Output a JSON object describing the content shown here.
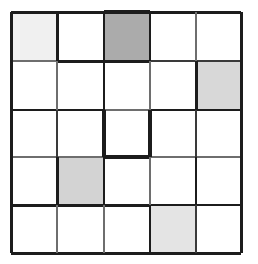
{
  "figure": {
    "name": "five-by-five-shaded-grid",
    "type": "grid",
    "rows": 5,
    "columns": 5,
    "background_color": "#ffffff",
    "line_color": "#1c1c1c",
    "default_cell_color": "#ffffff"
  },
  "geometry": {
    "x_lines": [
      11,
      57,
      104,
      150,
      196,
      241
    ],
    "y_lines": [
      12,
      61,
      110,
      157,
      205,
      253
    ]
  },
  "palette": {
    "white": "#ffffff",
    "very_light_gray": "#f0f0f0",
    "light_gray": "#e4e4e4",
    "light_medium_gray": "#d8d8d8",
    "medium_light_gray": "#d3d3d3",
    "medium_gray": "#ababab",
    "line_dark": "#1c1c1c",
    "line_mid": "#3a3a3a",
    "line_light": "#6e6e6e"
  },
  "shaded_cells": [
    {
      "name": "cell-r1c1",
      "row": 1,
      "col": 1,
      "color": "#f0f0f0",
      "shade": "very light gray"
    },
    {
      "name": "cell-r1c3",
      "row": 1,
      "col": 3,
      "color": "#ababab",
      "shade": "medium gray"
    },
    {
      "name": "cell-r2c5",
      "row": 2,
      "col": 5,
      "color": "#d8d8d8",
      "shade": "light medium gray"
    },
    {
      "name": "cell-r4c2",
      "row": 4,
      "col": 2,
      "color": "#d3d3d3",
      "shade": "medium light gray"
    },
    {
      "name": "cell-r5c4",
      "row": 5,
      "col": 4,
      "color": "#e4e4e4",
      "shade": "light gray"
    }
  ],
  "horizontal_segments": [
    {
      "name": "h-top-c1",
      "row_line": 0,
      "col": 1,
      "width": 3.0,
      "color": "#1c1c1c"
    },
    {
      "name": "h-top-c2",
      "row_line": 0,
      "col": 2,
      "width": 3.0,
      "color": "#1c1c1c"
    },
    {
      "name": "h-top-c3",
      "row_line": 0,
      "col": 3,
      "width": 3.4,
      "color": "#1c1c1c"
    },
    {
      "name": "h-top-c4",
      "row_line": 0,
      "col": 4,
      "width": 3.0,
      "color": "#1c1c1c"
    },
    {
      "name": "h-top-c5",
      "row_line": 0,
      "col": 5,
      "width": 3.0,
      "color": "#1c1c1c"
    },
    {
      "name": "h-r1-c1",
      "row_line": 1,
      "col": 1,
      "width": 1.6,
      "color": "#6e6e6e"
    },
    {
      "name": "h-r1-c2",
      "row_line": 1,
      "col": 2,
      "width": 3.0,
      "color": "#1c1c1c"
    },
    {
      "name": "h-r1-c3",
      "row_line": 1,
      "col": 3,
      "width": 3.0,
      "color": "#1c1c1c"
    },
    {
      "name": "h-r1-c4",
      "row_line": 1,
      "col": 4,
      "width": 2.0,
      "color": "#3a3a3a"
    },
    {
      "name": "h-r1-c5",
      "row_line": 1,
      "col": 5,
      "width": 2.0,
      "color": "#3a3a3a"
    },
    {
      "name": "h-r2-c1",
      "row_line": 2,
      "col": 1,
      "width": 2.6,
      "color": "#1c1c1c"
    },
    {
      "name": "h-r2-c2",
      "row_line": 2,
      "col": 2,
      "width": 2.6,
      "color": "#1c1c1c"
    },
    {
      "name": "h-r2-c3",
      "row_line": 2,
      "col": 3,
      "width": 1.6,
      "color": "#6e6e6e"
    },
    {
      "name": "h-r2-c4",
      "row_line": 2,
      "col": 4,
      "width": 2.6,
      "color": "#1c1c1c"
    },
    {
      "name": "h-r2-c5",
      "row_line": 2,
      "col": 5,
      "width": 2.6,
      "color": "#1c1c1c"
    },
    {
      "name": "h-r3-c1",
      "row_line": 3,
      "col": 1,
      "width": 1.4,
      "color": "#6e6e6e"
    },
    {
      "name": "h-r3-c2",
      "row_line": 3,
      "col": 2,
      "width": 1.6,
      "color": "#6e6e6e"
    },
    {
      "name": "h-r3-c3",
      "row_line": 3,
      "col": 3,
      "width": 3.4,
      "color": "#1c1c1c"
    },
    {
      "name": "h-r3-c4",
      "row_line": 3,
      "col": 4,
      "width": 1.6,
      "color": "#6e6e6e"
    },
    {
      "name": "h-r3-c5",
      "row_line": 3,
      "col": 5,
      "width": 1.6,
      "color": "#6e6e6e"
    },
    {
      "name": "h-r4-c1",
      "row_line": 4,
      "col": 1,
      "width": 3.0,
      "color": "#1c1c1c"
    },
    {
      "name": "h-r4-c2",
      "row_line": 4,
      "col": 2,
      "width": 3.0,
      "color": "#1c1c1c"
    },
    {
      "name": "h-r4-c3",
      "row_line": 4,
      "col": 3,
      "width": 3.0,
      "color": "#1c1c1c"
    },
    {
      "name": "h-r4-c4",
      "row_line": 4,
      "col": 4,
      "width": 2.4,
      "color": "#1c1c1c"
    },
    {
      "name": "h-r4-c5",
      "row_line": 4,
      "col": 5,
      "width": 2.4,
      "color": "#1c1c1c"
    },
    {
      "name": "h-bottom-c1",
      "row_line": 5,
      "col": 1,
      "width": 3.0,
      "color": "#1c1c1c"
    },
    {
      "name": "h-bottom-c2",
      "row_line": 5,
      "col": 2,
      "width": 3.0,
      "color": "#1c1c1c"
    },
    {
      "name": "h-bottom-c3",
      "row_line": 5,
      "col": 3,
      "width": 3.0,
      "color": "#1c1c1c"
    },
    {
      "name": "h-bottom-c4",
      "row_line": 5,
      "col": 4,
      "width": 3.0,
      "color": "#1c1c1c"
    },
    {
      "name": "h-bottom-c5",
      "row_line": 5,
      "col": 5,
      "width": 3.0,
      "color": "#1c1c1c"
    }
  ],
  "vertical_segments": [
    {
      "name": "v-left-r1",
      "col_line": 0,
      "row": 1,
      "width": 3.0,
      "color": "#1c1c1c"
    },
    {
      "name": "v-left-r2",
      "col_line": 0,
      "row": 2,
      "width": 3.0,
      "color": "#1c1c1c"
    },
    {
      "name": "v-left-r3",
      "col_line": 0,
      "row": 3,
      "width": 3.0,
      "color": "#1c1c1c"
    },
    {
      "name": "v-left-r4",
      "col_line": 0,
      "row": 4,
      "width": 3.0,
      "color": "#1c1c1c"
    },
    {
      "name": "v-left-r5",
      "col_line": 0,
      "row": 5,
      "width": 3.0,
      "color": "#1c1c1c"
    },
    {
      "name": "v-c1-r1",
      "col_line": 1,
      "row": 1,
      "width": 3.0,
      "color": "#1c1c1c"
    },
    {
      "name": "v-c1-r2",
      "col_line": 1,
      "row": 2,
      "width": 1.6,
      "color": "#6e6e6e"
    },
    {
      "name": "v-c1-r3",
      "col_line": 1,
      "row": 3,
      "width": 2.0,
      "color": "#3a3a3a"
    },
    {
      "name": "v-c1-r4",
      "col_line": 1,
      "row": 4,
      "width": 3.0,
      "color": "#1c1c1c"
    },
    {
      "name": "v-c1-r5",
      "col_line": 1,
      "row": 5,
      "width": 1.8,
      "color": "#6e6e6e"
    },
    {
      "name": "v-c2-r1",
      "col_line": 2,
      "row": 1,
      "width": 2.6,
      "color": "#1c1c1c"
    },
    {
      "name": "v-c2-r2",
      "col_line": 2,
      "row": 2,
      "width": 2.6,
      "color": "#1c1c1c"
    },
    {
      "name": "v-c2-r3",
      "col_line": 2,
      "row": 3,
      "width": 3.4,
      "color": "#1c1c1c"
    },
    {
      "name": "v-c2-r4",
      "col_line": 2,
      "row": 4,
      "width": 2.8,
      "color": "#1c1c1c"
    },
    {
      "name": "v-c2-r5",
      "col_line": 2,
      "row": 5,
      "width": 1.8,
      "color": "#6e6e6e"
    },
    {
      "name": "v-c3-r1",
      "col_line": 3,
      "row": 1,
      "width": 2.6,
      "color": "#1c1c1c"
    },
    {
      "name": "v-c3-r2",
      "col_line": 3,
      "row": 2,
      "width": 1.8,
      "color": "#6e6e6e"
    },
    {
      "name": "v-c3-r3",
      "col_line": 3,
      "row": 3,
      "width": 3.4,
      "color": "#1c1c1c"
    },
    {
      "name": "v-c3-r4",
      "col_line": 3,
      "row": 4,
      "width": 1.8,
      "color": "#6e6e6e"
    },
    {
      "name": "v-c3-r5",
      "col_line": 3,
      "row": 5,
      "width": 2.4,
      "color": "#1c1c1c"
    },
    {
      "name": "v-c4-r1",
      "col_line": 4,
      "row": 1,
      "width": 1.6,
      "color": "#6e6e6e"
    },
    {
      "name": "v-c4-r2",
      "col_line": 4,
      "row": 2,
      "width": 3.0,
      "color": "#1c1c1c"
    },
    {
      "name": "v-c4-r3",
      "col_line": 4,
      "row": 3,
      "width": 2.0,
      "color": "#3a3a3a"
    },
    {
      "name": "v-c4-r4",
      "col_line": 4,
      "row": 4,
      "width": 2.8,
      "color": "#1c1c1c"
    },
    {
      "name": "v-c4-r5",
      "col_line": 4,
      "row": 5,
      "width": 2.0,
      "color": "#3a3a3a"
    },
    {
      "name": "v-right-r1",
      "col_line": 5,
      "row": 1,
      "width": 3.0,
      "color": "#1c1c1c"
    },
    {
      "name": "v-right-r2",
      "col_line": 5,
      "row": 2,
      "width": 3.0,
      "color": "#1c1c1c"
    },
    {
      "name": "v-right-r3",
      "col_line": 5,
      "row": 3,
      "width": 3.0,
      "color": "#1c1c1c"
    },
    {
      "name": "v-right-r4",
      "col_line": 5,
      "row": 4,
      "width": 3.0,
      "color": "#1c1c1c"
    },
    {
      "name": "v-right-r5",
      "col_line": 5,
      "row": 5,
      "width": 3.0,
      "color": "#1c1c1c"
    }
  ]
}
